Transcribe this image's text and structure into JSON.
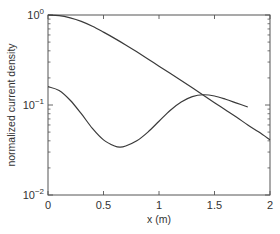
{
  "chart_data": {
    "type": "line",
    "title": "",
    "xlabel": "x (m)",
    "ylabel": "normalized current density",
    "xlim": [
      0,
      2
    ],
    "ylim": [
      0.01,
      1
    ],
    "yscale": "log",
    "grid": false,
    "legend": null,
    "x_ticks": [
      0,
      0.5,
      1,
      1.5,
      2
    ],
    "x_tick_labels": [
      "0",
      "0.5",
      "1",
      "1.5",
      "2"
    ],
    "y_ticks": [
      0.01,
      0.1,
      1
    ],
    "y_tick_labels": [
      {
        "base": "10",
        "exp": "−2"
      },
      {
        "base": "10",
        "exp": "−1"
      },
      {
        "base": "10",
        "exp": "0"
      }
    ],
    "series": [
      {
        "name": "curve-1",
        "x": [
          0,
          0.1,
          0.2,
          0.3,
          0.4,
          0.5,
          0.6,
          0.7,
          0.8,
          0.9,
          1.0,
          1.1,
          1.2,
          1.3,
          1.4,
          1.5,
          1.6,
          1.7,
          1.8,
          1.9,
          2.0
        ],
        "y": [
          1.0,
          0.985,
          0.93,
          0.85,
          0.75,
          0.645,
          0.55,
          0.465,
          0.39,
          0.325,
          0.27,
          0.225,
          0.187,
          0.155,
          0.128,
          0.106,
          0.088,
          0.073,
          0.06,
          0.05,
          0.041
        ]
      },
      {
        "name": "curve-2",
        "x": [
          0,
          0.1,
          0.2,
          0.3,
          0.4,
          0.5,
          0.6,
          0.65,
          0.7,
          0.8,
          0.9,
          1.0,
          1.1,
          1.2,
          1.3,
          1.4,
          1.5,
          1.6,
          1.7,
          1.8
        ],
        "y": [
          0.16,
          0.145,
          0.113,
          0.08,
          0.055,
          0.041,
          0.035,
          0.034,
          0.035,
          0.04,
          0.05,
          0.066,
          0.087,
          0.108,
          0.124,
          0.13,
          0.126,
          0.116,
          0.105,
          0.095
        ]
      }
    ]
  }
}
